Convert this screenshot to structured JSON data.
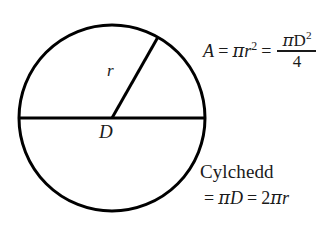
{
  "figure": {
    "background_color": "#ffffff",
    "stroke_color": "#000000",
    "text_color": "#1a1a1a"
  },
  "circle": {
    "center_x": 112,
    "center_y": 118,
    "radius": 93,
    "stroke_width": 3
  },
  "diameter_line": {
    "x1": 19,
    "y1": 118,
    "x2": 205,
    "y2": 118,
    "stroke_width": 3,
    "label": "D"
  },
  "radius_line": {
    "x1": 112,
    "y1": 118,
    "x2": 158,
    "y2": 37,
    "stroke_width": 3,
    "label": "r"
  },
  "area_formula": {
    "lhs": "A",
    "equals_1": "=",
    "term_1_pi": "π",
    "term_1_var": "r",
    "term_1_exp": "2",
    "equals_2": "=",
    "numerator_pi": "π",
    "numerator_var": "D",
    "numerator_exp": "2",
    "denominator": "4",
    "plain_text": "A = πr² = πD² / 4"
  },
  "circumference": {
    "label": "Cylchedd",
    "equals_1": "=",
    "term_1_pi": "π",
    "term_1_var": "D",
    "equals_2": "=",
    "term_2_coefficient": "2",
    "term_2_pi": "π",
    "term_2_var": "r",
    "plain_text": "Cylchedd = πD = 2πr"
  }
}
